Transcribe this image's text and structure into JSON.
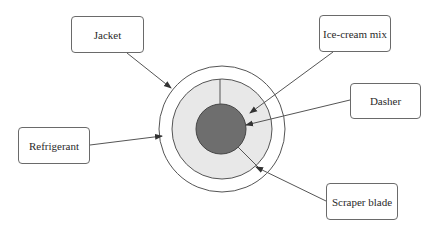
{
  "diagram": {
    "labels": {
      "jacket": "Jacket",
      "ice_cream_mix": "Ice-cream mix",
      "dasher": "Dasher",
      "refrigerant": "Refrigerant",
      "scraper_blade": "Scraper blade"
    },
    "colors": {
      "line": "#555555",
      "mix_fill": "#e8e8e8",
      "dasher_fill": "#6e6e6e",
      "background": "#ffffff"
    }
  }
}
